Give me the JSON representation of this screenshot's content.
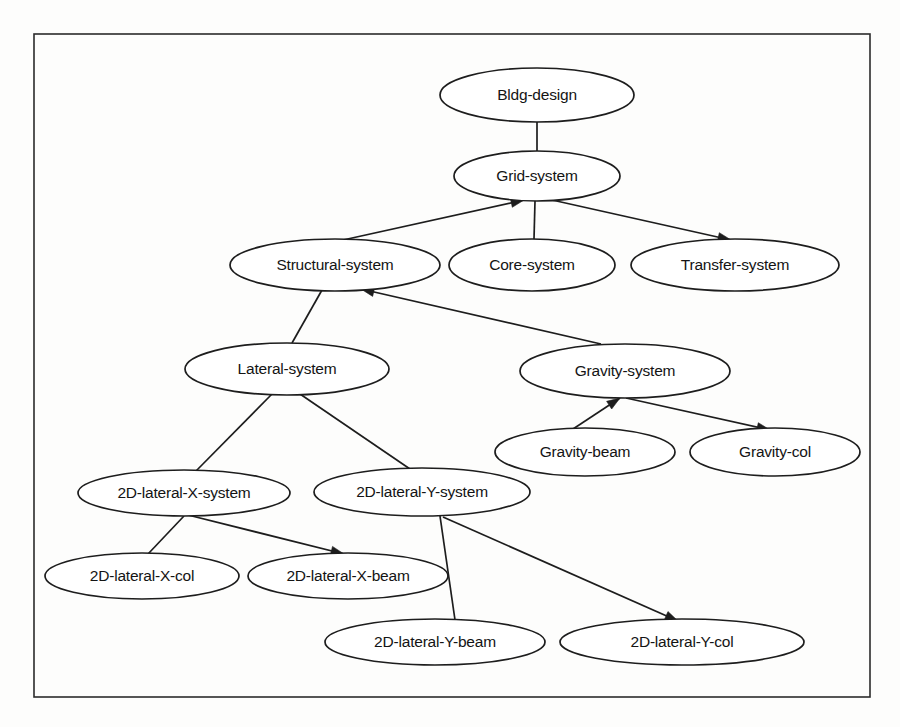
{
  "diagram": {
    "type": "hierarchy-graph",
    "frame": {
      "x": 34,
      "y": 34,
      "width": 836,
      "height": 663
    },
    "colors": {
      "background": "#fdfdfc",
      "stroke": "#1d1d1d",
      "frame_stroke": "#2b2b2b",
      "node_fill": "#ffffff",
      "label": "#141414"
    },
    "nodes": [
      {
        "id": "bldg-design",
        "label": "Bldg-design",
        "cx": 537,
        "cy": 95,
        "rx": 97,
        "ry": 27
      },
      {
        "id": "grid-system",
        "label": "Grid-system",
        "cx": 537,
        "cy": 176,
        "rx": 83,
        "ry": 25
      },
      {
        "id": "structural-system",
        "label": "Structural-system",
        "cx": 335,
        "cy": 265,
        "rx": 105,
        "ry": 26
      },
      {
        "id": "core-system",
        "label": "Core-system",
        "cx": 532,
        "cy": 265,
        "rx": 83,
        "ry": 26
      },
      {
        "id": "transfer-system",
        "label": "Transfer-system",
        "cx": 735,
        "cy": 265,
        "rx": 104,
        "ry": 26
      },
      {
        "id": "lateral-system",
        "label": "Lateral-system",
        "cx": 287,
        "cy": 369,
        "rx": 102,
        "ry": 26
      },
      {
        "id": "gravity-system",
        "label": "Gravity-system",
        "cx": 625,
        "cy": 371,
        "rx": 105,
        "ry": 27
      },
      {
        "id": "gravity-beam",
        "label": "Gravity-beam",
        "cx": 585,
        "cy": 452,
        "rx": 90,
        "ry": 24
      },
      {
        "id": "gravity-col",
        "label": "Gravity-col",
        "cx": 775,
        "cy": 452,
        "rx": 85,
        "ry": 24
      },
      {
        "id": "2d-lateral-x-system",
        "label": "2D-lateral-X-system",
        "cx": 184,
        "cy": 493,
        "rx": 106,
        "ry": 23
      },
      {
        "id": "2d-lateral-y-system",
        "label": "2D-lateral-Y-system",
        "cx": 422,
        "cy": 492,
        "rx": 108,
        "ry": 24
      },
      {
        "id": "2d-lateral-x-col",
        "label": "2D-lateral-X-col",
        "cx": 142,
        "cy": 576,
        "rx": 97,
        "ry": 23
      },
      {
        "id": "2d-lateral-x-beam",
        "label": "2D-lateral-X-beam",
        "cx": 348,
        "cy": 576,
        "rx": 100,
        "ry": 23
      },
      {
        "id": "2d-lateral-y-beam",
        "label": "2D-lateral-Y-beam",
        "cx": 435,
        "cy": 642,
        "rx": 110,
        "ry": 23
      },
      {
        "id": "2d-lateral-y-col",
        "label": "2D-lateral-Y-col",
        "cx": 682,
        "cy": 642,
        "rx": 122,
        "ry": 23
      }
    ],
    "edges": [
      {
        "id": "e1",
        "from": "bldg-design",
        "to": "grid-system",
        "x1": 537,
        "y1": 122,
        "x2": 537,
        "y2": 151,
        "arrow": false
      },
      {
        "id": "e2",
        "from": "structural-system",
        "to": "grid-system",
        "x1": 343,
        "y1": 240,
        "x2": 524,
        "y2": 200,
        "arrow": true
      },
      {
        "id": "e3",
        "from": "core-system",
        "to": "grid-system",
        "x1": 534,
        "y1": 239,
        "x2": 535,
        "y2": 201,
        "arrow": false
      },
      {
        "id": "e4",
        "from": "grid-system",
        "to": "transfer-system",
        "x1": 552,
        "y1": 200,
        "x2": 731,
        "y2": 240,
        "arrow": true
      },
      {
        "id": "e5",
        "from": "structural-system",
        "to": "lateral-system",
        "x1": 322,
        "y1": 290,
        "x2": 292,
        "y2": 343,
        "arrow": false
      },
      {
        "id": "e6",
        "from": "structural-system",
        "to": "gravity-system",
        "x1": 361,
        "y1": 289,
        "x2": 601,
        "y2": 344,
        "arrow": true,
        "arrow_at": "from"
      },
      {
        "id": "e7",
        "from": "lateral-system",
        "to": "2d-lateral-x-system",
        "x1": 272,
        "y1": 394,
        "x2": 196,
        "y2": 471,
        "arrow": false
      },
      {
        "id": "e8",
        "from": "lateral-system",
        "to": "2d-lateral-y-system",
        "x1": 300,
        "y1": 394,
        "x2": 410,
        "y2": 469,
        "arrow": false
      },
      {
        "id": "e9",
        "from": "gravity-system",
        "to": "gravity-beam",
        "x1": 620,
        "y1": 398,
        "x2": 573,
        "y2": 429,
        "arrow": true,
        "arrow_at": "from"
      },
      {
        "id": "e10",
        "from": "gravity-system",
        "to": "gravity-col",
        "x1": 626,
        "y1": 398,
        "x2": 770,
        "y2": 430,
        "arrow": true
      },
      {
        "id": "e11",
        "from": "2d-lateral-x-system",
        "to": "2d-lateral-x-col",
        "x1": 184,
        "y1": 516,
        "x2": 148,
        "y2": 554,
        "arrow": false
      },
      {
        "id": "e12",
        "from": "2d-lateral-x-system",
        "to": "2d-lateral-x-beam",
        "x1": 188,
        "y1": 515,
        "x2": 344,
        "y2": 554,
        "arrow": true,
        "arrow_at": "to"
      },
      {
        "id": "e13",
        "from": "2d-lateral-y-system",
        "to": "2d-lateral-y-beam",
        "x1": 440,
        "y1": 516,
        "x2": 455,
        "y2": 620,
        "arrow": false
      },
      {
        "id": "e14",
        "from": "2d-lateral-y-system",
        "to": "2d-lateral-y-col",
        "x1": 443,
        "y1": 517,
        "x2": 678,
        "y2": 621,
        "arrow": true
      }
    ]
  }
}
